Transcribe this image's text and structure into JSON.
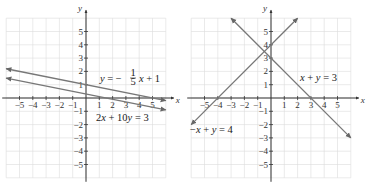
{
  "chart_data": [
    {
      "type": "line",
      "title": "",
      "xlabel": "x",
      "ylabel": "y",
      "xlim": [
        -6,
        6
      ],
      "ylim": [
        -6,
        6
      ],
      "grid": true,
      "x_ticks": [
        -5,
        -4,
        -3,
        -2,
        -1,
        1,
        2,
        3,
        4,
        5
      ],
      "y_ticks": [
        5,
        4,
        3,
        2,
        1,
        -1,
        -2,
        -3,
        -4,
        -5
      ],
      "series": [
        {
          "name": "y = -1/5 x + 1",
          "equation": "y = −(1/5)x + 1",
          "slope": -0.2,
          "intercept": 1,
          "x": [
            -6,
            6
          ],
          "y": [
            2.2,
            -0.2
          ]
        },
        {
          "name": "2x + 10y = 3",
          "equation": "2x + 10y = 3",
          "slope": -0.2,
          "intercept": 0.3,
          "x": [
            -6,
            6
          ],
          "y": [
            1.5,
            -0.9
          ]
        }
      ],
      "annotations": [
        "y = −(1/5)x + 1",
        "2x + 10y = 3"
      ]
    },
    {
      "type": "line",
      "title": "",
      "xlabel": "x",
      "ylabel": "y",
      "xlim": [
        -6,
        6
      ],
      "ylim": [
        -6,
        6
      ],
      "grid": true,
      "x_ticks": [
        -5,
        -4,
        -3,
        -2,
        -1,
        1,
        2,
        3,
        4,
        5
      ],
      "y_ticks": [
        5,
        4,
        3,
        2,
        1,
        -1,
        -2,
        -3,
        -4,
        -5
      ],
      "series": [
        {
          "name": "x + y = 3",
          "equation": "x + y = 3",
          "slope": -1,
          "intercept": 3,
          "x": [
            -3,
            6
          ],
          "y": [
            6,
            -3
          ]
        },
        {
          "name": "-x + y = 4",
          "equation": "−x + y = 4",
          "slope": 1,
          "intercept": 4,
          "x": [
            -6,
            2
          ],
          "y": [
            -2,
            6
          ]
        }
      ],
      "annotations": [
        "x + y = 3",
        "−x + y = 4"
      ]
    }
  ],
  "left": {
    "y_axis_label": "y",
    "x_axis_label": "x",
    "eq1": {
      "lhs": "y = −",
      "num": "1",
      "den": "5",
      "rhs": "x + 1"
    },
    "eq2": "2x + 10y = 3"
  },
  "right": {
    "y_axis_label": "y",
    "x_axis_label": "x",
    "eq1": "x + y = 3",
    "eq2": "−x + y = 4"
  }
}
